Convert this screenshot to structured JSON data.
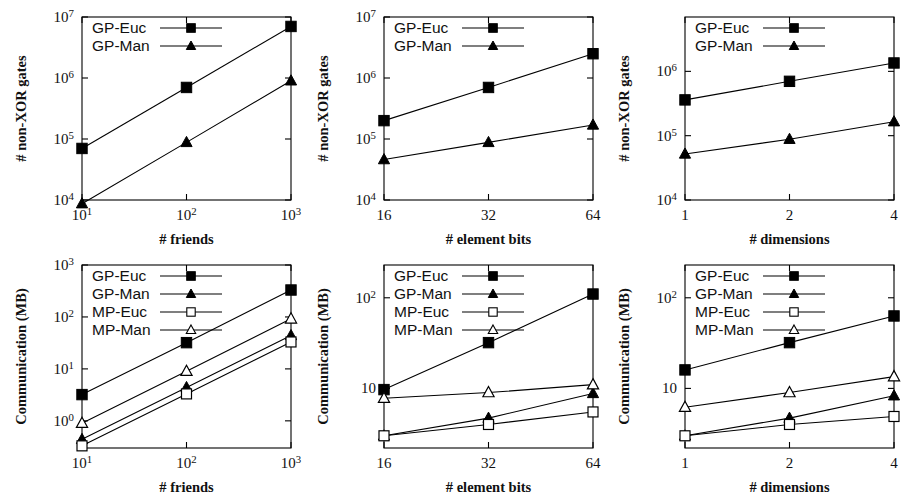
{
  "figure": {
    "panel_count": 6,
    "rows": 2,
    "cols": 3
  },
  "legend_labels": {
    "gp_euc": "GP-Euc",
    "gp_man": "GP-Man",
    "mp_euc": "MP-Euc",
    "mp_man": "MP-Man"
  },
  "markers": {
    "gp_euc": "filled-square",
    "gp_man": "filled-triangle",
    "mp_euc": "open-square",
    "mp_man": "open-triangle"
  },
  "colors": {
    "line": "#000000",
    "marker_fill": "#000000",
    "marker_open_fill": "#ffffff",
    "frame": "#000000",
    "background": "#ffffff"
  },
  "chart_data": [
    {
      "id": "panel-top-left",
      "type": "line",
      "title": "",
      "xlabel": "# friends",
      "ylabel": "# non-XOR gates",
      "xscale": "log",
      "yscale": "log",
      "x": [
        10,
        100,
        1000
      ],
      "xtick_labels": [
        "10¹",
        "10²",
        "10³"
      ],
      "xtick_base": [
        10,
        10,
        10
      ],
      "xtick_exp": [
        1,
        2,
        3
      ],
      "ytick_labels": [
        "10⁴",
        "10⁵",
        "10⁶",
        "10⁷"
      ],
      "ytick_values": [
        10000,
        100000,
        1000000,
        10000000
      ],
      "xlim": [
        10,
        1000
      ],
      "ylim": [
        10000,
        10000000
      ],
      "grid": false,
      "legend_position": "top-left",
      "series": [
        {
          "name": "GP-Euc",
          "marker": "filled-square",
          "values": [
            70000,
            700000,
            7000000
          ]
        },
        {
          "name": "GP-Man",
          "marker": "filled-triangle",
          "values": [
            8700,
            88000,
            900000
          ]
        }
      ]
    },
    {
      "id": "panel-top-center",
      "type": "line",
      "title": "",
      "xlabel": "# element bits",
      "ylabel": "# non-XOR gates",
      "xscale": "linear",
      "yscale": "log",
      "x": [
        16,
        32,
        64
      ],
      "xtick_labels": [
        "16",
        "32",
        "64"
      ],
      "ytick_labels": [
        "10⁴",
        "10⁵",
        "10⁶",
        "10⁷"
      ],
      "ytick_values": [
        10000,
        100000,
        1000000,
        10000000
      ],
      "xlim": [
        16,
        64
      ],
      "ylim": [
        10000,
        10000000
      ],
      "grid": false,
      "legend_position": "top-left",
      "series": [
        {
          "name": "GP-Euc",
          "marker": "filled-square",
          "values": [
            200000,
            700000,
            2500000
          ]
        },
        {
          "name": "GP-Man",
          "marker": "filled-triangle",
          "values": [
            46000,
            88000,
            170000
          ]
        }
      ]
    },
    {
      "id": "panel-top-right",
      "type": "line",
      "title": "",
      "xlabel": "# dimensions",
      "ylabel": "# non-XOR gates",
      "xscale": "linear",
      "yscale": "log",
      "x": [
        1,
        2,
        4
      ],
      "xtick_labels": [
        "1",
        "2",
        "4"
      ],
      "ytick_labels": [
        "10⁴",
        "10⁵",
        "10⁶"
      ],
      "ytick_values": [
        10000,
        100000,
        1000000
      ],
      "xlim": [
        1,
        4
      ],
      "ylim": [
        10000,
        7000000
      ],
      "grid": false,
      "legend_position": "top-left",
      "series": [
        {
          "name": "GP-Euc",
          "marker": "filled-square",
          "values": [
            360000,
            700000,
            1350000
          ]
        },
        {
          "name": "GP-Man",
          "marker": "filled-triangle",
          "values": [
            52000,
            88000,
            165000
          ]
        }
      ]
    },
    {
      "id": "panel-bottom-left",
      "type": "line",
      "title": "",
      "xlabel": "# friends",
      "ylabel": "Communication (MB)",
      "xscale": "log",
      "yscale": "log",
      "x": [
        10,
        100,
        1000
      ],
      "xtick_labels": [
        "10¹",
        "10²",
        "10³"
      ],
      "ytick_labels": [
        "10⁰",
        "10¹",
        "10²",
        "10³"
      ],
      "ytick_values": [
        1,
        10,
        100,
        1000
      ],
      "xlim": [
        10,
        1000
      ],
      "ylim": [
        0.3,
        1000
      ],
      "grid": false,
      "legend_position": "top-left",
      "series": [
        {
          "name": "GP-Euc",
          "marker": "filled-square",
          "values": [
            3.2,
            32,
            330
          ]
        },
        {
          "name": "GP-Man",
          "marker": "filled-triangle",
          "values": [
            0.44,
            4.4,
            44
          ]
        },
        {
          "name": "MP-Euc",
          "marker": "open-square",
          "values": [
            0.33,
            3.3,
            33
          ]
        },
        {
          "name": "MP-Man",
          "marker": "open-triangle",
          "values": [
            0.9,
            9,
            92
          ]
        }
      ]
    },
    {
      "id": "panel-bottom-center",
      "type": "line",
      "title": "",
      "xlabel": "# element bits",
      "ylabel": "Communication (MB)",
      "xscale": "linear",
      "yscale": "log",
      "x": [
        16,
        32,
        64
      ],
      "xtick_labels": [
        "16",
        "32",
        "64"
      ],
      "ytick_labels": [
        "10",
        "10²"
      ],
      "ytick_values": [
        10,
        100
      ],
      "xlim": [
        16,
        64
      ],
      "ylim": [
        2.2,
        230
      ],
      "grid": false,
      "legend_position": "top-left",
      "series": [
        {
          "name": "GP-Euc",
          "marker": "filled-square",
          "values": [
            9.7,
            32,
            110
          ]
        },
        {
          "name": "GP-Man",
          "marker": "filled-triangle",
          "values": [
            3.0,
            4.7,
            8.8
          ]
        },
        {
          "name": "MP-Euc",
          "marker": "open-square",
          "values": [
            3.0,
            4.0,
            5.5
          ]
        },
        {
          "name": "MP-Man",
          "marker": "open-triangle",
          "values": [
            7.8,
            9.0,
            11.0
          ]
        }
      ]
    },
    {
      "id": "panel-bottom-right",
      "type": "line",
      "title": "",
      "xlabel": "# dimensions",
      "ylabel": "Communication (MB)",
      "xscale": "linear",
      "yscale": "log",
      "x": [
        1,
        2,
        4
      ],
      "xtick_labels": [
        "1",
        "2",
        "4"
      ],
      "ytick_labels": [
        "10",
        "10²"
      ],
      "ytick_values": [
        10,
        100
      ],
      "xlim": [
        1,
        4
      ],
      "ylim": [
        2.2,
        230
      ],
      "grid": false,
      "legend_position": "top-left",
      "series": [
        {
          "name": "GP-Euc",
          "marker": "filled-square",
          "values": [
            16,
            32,
            63
          ]
        },
        {
          "name": "GP-Man",
          "marker": "filled-triangle",
          "values": [
            3.0,
            4.7,
            8.3
          ]
        },
        {
          "name": "MP-Euc",
          "marker": "open-square",
          "values": [
            3.0,
            4.0,
            4.9
          ]
        },
        {
          "name": "MP-Man",
          "marker": "open-triangle",
          "values": [
            6.2,
            9.0,
            13.5
          ]
        }
      ]
    }
  ]
}
